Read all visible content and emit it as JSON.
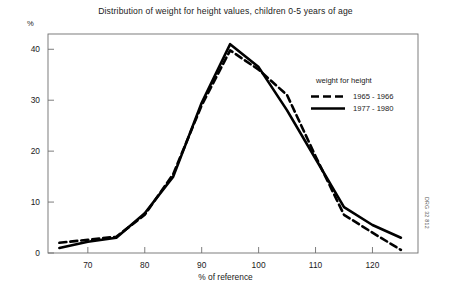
{
  "figure": {
    "title": "Distribution of weight for height values, children 0-5 years of age",
    "side_code": "DRG 32 812"
  },
  "legend": {
    "title": "weight for height",
    "entries": [
      {
        "label": "1965 - 1966",
        "style": "dashed"
      },
      {
        "label": "1977 - 1980",
        "style": "solid"
      }
    ]
  },
  "axes": {
    "y_unit": "%",
    "x_title": "% of reference",
    "y_ticks": [
      "0",
      "10",
      "20",
      "30",
      "40"
    ],
    "x_ticks": [
      "70",
      "80",
      "90",
      "100",
      "110",
      "120"
    ]
  },
  "chart_data": {
    "type": "line",
    "title": "Distribution of weight for height values, children 0-5 years of age",
    "xlabel": "% of reference",
    "ylabel": "%",
    "xlim": [
      63,
      128
    ],
    "ylim": [
      0,
      43
    ],
    "y_ticks": [
      0,
      10,
      20,
      30,
      40
    ],
    "x_ticks": [
      70,
      80,
      90,
      100,
      110,
      120
    ],
    "grid": false,
    "legend_position": "upper right",
    "legend_title": "weight for height",
    "series": [
      {
        "name": "1965 - 1966",
        "style": "dashed",
        "color": "#000000",
        "x": [
          65,
          70,
          75,
          80,
          85,
          90,
          95,
          100,
          105,
          110,
          115,
          120,
          125
        ],
        "y": [
          2.0,
          2.6,
          3.2,
          7.5,
          15.5,
          29.0,
          39.8,
          36.0,
          31.0,
          19.0,
          7.5,
          4.0,
          0.6
        ]
      },
      {
        "name": "1977 - 1980",
        "style": "solid",
        "color": "#000000",
        "x": [
          65,
          70,
          75,
          80,
          85,
          90,
          95,
          100,
          105,
          110,
          115,
          120,
          125
        ],
        "y": [
          1.0,
          2.2,
          3.0,
          7.8,
          15.0,
          29.5,
          41.0,
          36.5,
          28.0,
          18.5,
          9.0,
          5.5,
          3.0
        ]
      }
    ]
  }
}
